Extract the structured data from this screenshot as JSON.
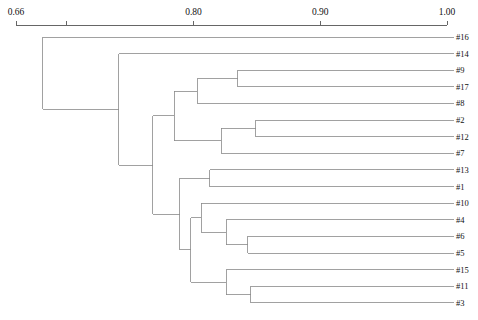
{
  "figure": {
    "type": "dendrogram",
    "orientation": "horizontal-left-root",
    "background_color": "#ffffff",
    "line_color": "#8a8a8a",
    "axis_color": "#555555",
    "text_color": "#111111"
  },
  "axis": {
    "position": "top",
    "min_value": 0.66,
    "max_value": 1.0,
    "ticks": [
      {
        "value": 0.66,
        "label": "0.66",
        "labelled": true
      },
      {
        "value": 0.7,
        "label": "",
        "labelled": false
      },
      {
        "value": 0.8,
        "label": "0.80",
        "labelled": true
      },
      {
        "value": 0.9,
        "label": "0.90",
        "labelled": true
      },
      {
        "value": 1.0,
        "label": "1.00",
        "labelled": true
      }
    ],
    "tick_labels": [
      "0.66",
      "0.80",
      "0.90",
      "1.00"
    ]
  },
  "leaves": [
    {
      "label": "#16",
      "order": 1
    },
    {
      "label": "#14",
      "order": 2
    },
    {
      "label": "#9",
      "order": 3
    },
    {
      "label": "#17",
      "order": 4
    },
    {
      "label": "#8",
      "order": 5
    },
    {
      "label": "#2",
      "order": 6
    },
    {
      "label": "#12",
      "order": 7
    },
    {
      "label": "#7",
      "order": 8
    },
    {
      "label": "#13",
      "order": 9
    },
    {
      "label": "#1",
      "order": 10
    },
    {
      "label": "#10",
      "order": 11
    },
    {
      "label": "#4",
      "order": 12
    },
    {
      "label": "#6",
      "order": 13
    },
    {
      "label": "#5",
      "order": 14
    },
    {
      "label": "#15",
      "order": 15
    },
    {
      "label": "#11",
      "order": 16
    },
    {
      "label": "#3",
      "order": 17
    }
  ],
  "chart_data": {
    "type": "dendrogram",
    "title": "",
    "xlabel": "",
    "ylabel": "",
    "xlim": [
      0.66,
      1.0
    ],
    "grid": false,
    "legend": "none",
    "leaf_labels": [
      "#16",
      "#14",
      "#9",
      "#17",
      "#8",
      "#2",
      "#12",
      "#7",
      "#13",
      "#1",
      "#10",
      "#4",
      "#6",
      "#5",
      "#15",
      "#11",
      "#3"
    ],
    "merges": [
      {
        "id": "n1",
        "children": [
          "#9",
          "#17"
        ],
        "similarity": 0.835,
        "leaf_span": [
          3,
          4
        ]
      },
      {
        "id": "n2",
        "children": [
          "n1",
          "#8"
        ],
        "similarity": 0.803,
        "leaf_span": [
          3,
          5
        ]
      },
      {
        "id": "n3",
        "children": [
          "#2",
          "#12"
        ],
        "similarity": 0.849,
        "leaf_span": [
          6,
          7
        ]
      },
      {
        "id": "n4",
        "children": [
          "n3",
          "#7"
        ],
        "similarity": 0.822,
        "leaf_span": [
          6,
          8
        ]
      },
      {
        "id": "n5",
        "children": [
          "n2",
          "n4"
        ],
        "similarity": 0.785,
        "leaf_span": [
          3,
          8
        ]
      },
      {
        "id": "n6",
        "children": [
          "#13",
          "#1"
        ],
        "similarity": 0.813,
        "leaf_span": [
          9,
          10
        ]
      },
      {
        "id": "n7",
        "children": [
          "#6",
          "#5"
        ],
        "similarity": 0.843,
        "leaf_span": [
          13,
          14
        ]
      },
      {
        "id": "n8",
        "children": [
          "#4",
          "n7"
        ],
        "similarity": 0.826,
        "leaf_span": [
          12,
          14
        ]
      },
      {
        "id": "n9",
        "children": [
          "#10",
          "n8"
        ],
        "similarity": 0.806,
        "leaf_span": [
          11,
          14
        ]
      },
      {
        "id": "n10",
        "children": [
          "#11",
          "#3"
        ],
        "similarity": 0.845,
        "leaf_span": [
          16,
          17
        ]
      },
      {
        "id": "n11",
        "children": [
          "#15",
          "n10"
        ],
        "similarity": 0.826,
        "leaf_span": [
          15,
          17
        ]
      },
      {
        "id": "n12",
        "children": [
          "n9",
          "n11"
        ],
        "similarity": 0.798,
        "leaf_span": [
          11,
          17
        ]
      },
      {
        "id": "n13",
        "children": [
          "n6",
          "n12"
        ],
        "similarity": 0.789,
        "leaf_span": [
          9,
          17
        ]
      },
      {
        "id": "n14",
        "children": [
          "n5",
          "n13"
        ],
        "similarity": 0.768,
        "leaf_span": [
          3,
          17
        ]
      },
      {
        "id": "n15",
        "children": [
          "#14",
          "n14"
        ],
        "similarity": 0.741,
        "leaf_span": [
          2,
          17
        ]
      },
      {
        "id": "n16",
        "children": [
          "#16",
          "n15"
        ],
        "similarity": 0.681,
        "leaf_span": [
          1,
          17
        ]
      }
    ]
  }
}
